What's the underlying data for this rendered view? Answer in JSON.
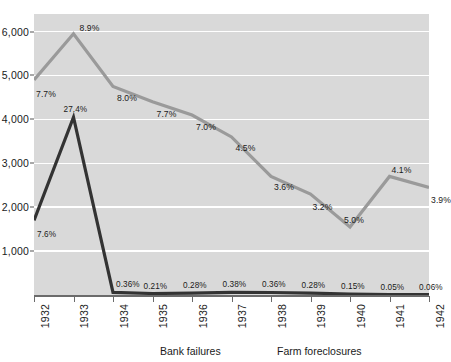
{
  "chart_data": {
    "type": "line",
    "title": "",
    "xlabel": "",
    "ylabel": "",
    "x": [
      "1932",
      "1933",
      "1934",
      "1935",
      "1936",
      "1937",
      "1938",
      "1939",
      "1940",
      "1941",
      "1942"
    ],
    "ylim": [
      0,
      6400
    ],
    "yticks": [
      "1,000",
      "2,000",
      "3,000",
      "4,000",
      "5,000",
      "6,000"
    ],
    "ytick_values": [
      1000,
      2000,
      3000,
      4000,
      5000,
      6000
    ],
    "grid": true,
    "legend_position": "bottom",
    "series": [
      {
        "name": "Bank failures",
        "color": "#333333",
        "values": [
          1700,
          4050,
          61,
          34,
          44,
          60,
          57,
          44,
          23,
          8,
          9
        ],
        "labels": [
          "7.6%",
          "27.4%",
          "0.36%",
          "0.21%",
          "0.28%",
          "0.38%",
          "0.36%",
          "0.28%",
          "0.15%",
          "0.05%",
          "0.06%"
        ]
      },
      {
        "name": "Farm foreclosures",
        "color": "#9a9a9a",
        "values": [
          4900,
          5950,
          4750,
          4400,
          4100,
          3600,
          2700,
          2300,
          1550,
          2700,
          2450
        ],
        "labels": [
          "7.7%",
          "8.9%",
          "8.0%",
          "7.7%",
          "7.0%",
          "4.5%",
          "3.6%",
          "3.2%",
          "5.0%",
          "4.1%",
          "3.9%"
        ]
      }
    ]
  },
  "legend": {
    "bank_failures": "Bank failures",
    "farm_foreclosures": "Farm foreclosures"
  }
}
